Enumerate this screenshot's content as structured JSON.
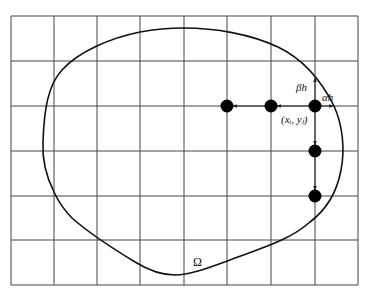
{
  "figure": {
    "type": "finite-difference grid over irregular domain",
    "grid": {
      "columns": 8,
      "rows": 6,
      "x_lines": [
        11,
        54,
        97,
        140,
        184,
        227,
        271,
        315,
        358
      ],
      "y_lines": [
        16,
        61,
        106,
        151,
        196,
        240,
        285
      ]
    },
    "domain_label": "Ω",
    "labels": {
      "point": "(xᵢ, yⱼ)",
      "beta_h": "βh",
      "alpha_h": "αh"
    },
    "nodes": [
      {
        "x": 227,
        "y": 106
      },
      {
        "x": 271,
        "y": 106
      },
      {
        "x": 315,
        "y": 106
      },
      {
        "x": 315,
        "y": 151
      },
      {
        "x": 315,
        "y": 196
      }
    ],
    "colors": {
      "grid": "#444444",
      "boundary": "#111111",
      "node": "#000000",
      "background": "#ffffff"
    }
  }
}
